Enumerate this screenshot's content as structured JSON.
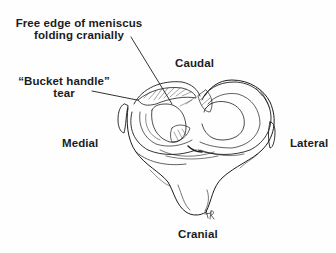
{
  "figure": {
    "ink_color": "#1c1c1c",
    "background": "#fefefe",
    "labels": {
      "free_edge_line1": "Free edge of meniscus",
      "free_edge_line2": "folding cranially",
      "caudal": "Caudal",
      "bucket_handle_line1": "“Bucket handle”",
      "bucket_handle_line2": "tear",
      "medial": "Medial",
      "lateral": "Lateral",
      "cranial": "Cranial"
    },
    "signature": "AP"
  }
}
